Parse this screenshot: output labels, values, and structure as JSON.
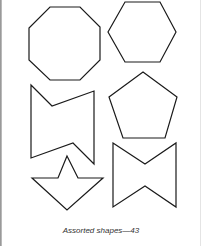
{
  "caption": "Assorted shapes—43",
  "shapes": [
    {
      "name": "octagon",
      "sides": 8
    },
    {
      "name": "hexagon",
      "sides": 6
    },
    {
      "name": "concave-bowtie-left",
      "sides": 6
    },
    {
      "name": "pentagon",
      "sides": 5
    },
    {
      "name": "concave-bowtie-right",
      "sides": 6
    },
    {
      "name": "arrowhead-star",
      "sides": 6
    }
  ],
  "colors": {
    "stroke": "#1a1a1a",
    "background": "#ffffff"
  }
}
